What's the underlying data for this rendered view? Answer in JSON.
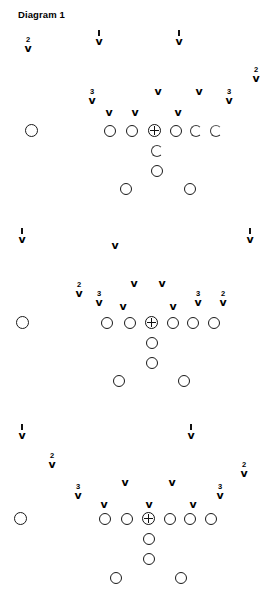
{
  "page": {
    "title": "Diagram 1",
    "background_color": "#ffffff",
    "ink_color": "#111111",
    "width": 271,
    "height": 606
  },
  "legend": {
    "offense_symbol": "open-circle",
    "center_symbol": "circle-with-cross",
    "defense_symbol": "chevron-v",
    "level_labels": [
      "1",
      "2",
      "3"
    ]
  },
  "diagrams": [
    {
      "id": "diagram-1",
      "name": "Diagram 1",
      "title": "Diagram 1",
      "title_x": 18,
      "title_y": 10,
      "offense": [
        {
          "name": "split-end-left",
          "x": 25,
          "y": 124,
          "size": "lg",
          "style": "solid"
        },
        {
          "name": "left-tackle",
          "x": 104,
          "y": 125,
          "size": "md",
          "style": "solid"
        },
        {
          "name": "left-guard",
          "x": 126,
          "y": 125,
          "size": "md",
          "style": "solid"
        },
        {
          "name": "right-guard",
          "x": 170,
          "y": 125,
          "size": "md",
          "style": "solid"
        },
        {
          "name": "right-tackle",
          "x": 190,
          "y": 125,
          "size": "md",
          "style": "clip"
        },
        {
          "name": "tight-end",
          "x": 210,
          "y": 125,
          "size": "md",
          "style": "clip2"
        },
        {
          "name": "quarterback",
          "x": 151,
          "y": 145,
          "size": "md",
          "style": "clip"
        },
        {
          "name": "fullback",
          "x": 151,
          "y": 165,
          "size": "md",
          "style": "solid"
        },
        {
          "name": "halfback-left",
          "x": 120,
          "y": 183,
          "size": "md",
          "style": "solid"
        },
        {
          "name": "halfback-right",
          "x": 184,
          "y": 183,
          "size": "md",
          "style": "solid"
        }
      ],
      "center": {
        "name": "center",
        "x": 148,
        "y": 124
      },
      "defense": [
        {
          "name": "defender-deep-left",
          "label": "2",
          "mark": "number",
          "x": 21,
          "y": 36
        },
        {
          "name": "defender-deep-midleft",
          "label": "1",
          "mark": "tick",
          "x": 92,
          "y": 30
        },
        {
          "name": "defender-deep-midright",
          "label": "1",
          "mark": "tick",
          "x": 172,
          "y": 30
        },
        {
          "name": "defender-deep-right",
          "label": "2",
          "mark": "number",
          "x": 249,
          "y": 66
        },
        {
          "name": "defender-lb-left",
          "label": "3",
          "mark": "number",
          "x": 85,
          "y": 88
        },
        {
          "name": "defender-mid-left",
          "label": "",
          "mark": "none",
          "x": 151,
          "y": 78
        },
        {
          "name": "defender-mid-right",
          "label": "",
          "mark": "none",
          "x": 192,
          "y": 78
        },
        {
          "name": "defender-line-1",
          "label": "",
          "mark": "none",
          "x": 102,
          "y": 99
        },
        {
          "name": "defender-line-2",
          "label": "",
          "mark": "none",
          "x": 128,
          "y": 99
        },
        {
          "name": "defender-line-3",
          "label": "",
          "mark": "none",
          "x": 171,
          "y": 99
        },
        {
          "name": "defender-lb-right",
          "label": "3",
          "mark": "number",
          "x": 222,
          "y": 88
        }
      ]
    },
    {
      "id": "diagram-2",
      "name": "Diagram 2",
      "title": "",
      "title_x": 0,
      "title_y": 0,
      "offense": [
        {
          "name": "split-end-left",
          "x": 16,
          "y": 316,
          "size": "lg",
          "style": "solid"
        },
        {
          "name": "left-tackle",
          "x": 101,
          "y": 317,
          "size": "md",
          "style": "solid"
        },
        {
          "name": "left-guard",
          "x": 124,
          "y": 317,
          "size": "md",
          "style": "solid"
        },
        {
          "name": "right-guard",
          "x": 167,
          "y": 317,
          "size": "md",
          "style": "solid"
        },
        {
          "name": "right-tackle",
          "x": 187,
          "y": 317,
          "size": "md",
          "style": "solid"
        },
        {
          "name": "tight-end",
          "x": 208,
          "y": 317,
          "size": "md",
          "style": "solid"
        },
        {
          "name": "quarterback",
          "x": 146,
          "y": 337,
          "size": "md",
          "style": "solid"
        },
        {
          "name": "fullback",
          "x": 146,
          "y": 357,
          "size": "md",
          "style": "solid"
        },
        {
          "name": "halfback-left",
          "x": 113,
          "y": 375,
          "size": "md",
          "style": "solid"
        },
        {
          "name": "halfback-right",
          "x": 178,
          "y": 375,
          "size": "md",
          "style": "solid"
        }
      ],
      "center": {
        "name": "center",
        "x": 145,
        "y": 316
      },
      "defense": [
        {
          "name": "defender-deep-left",
          "label": "1",
          "mark": "tick",
          "x": 15,
          "y": 228
        },
        {
          "name": "defender-deep-mid",
          "label": "",
          "mark": "none",
          "x": 108,
          "y": 232
        },
        {
          "name": "defender-deep-right",
          "label": "1",
          "mark": "tick",
          "x": 243,
          "y": 228
        },
        {
          "name": "defender-mid-left",
          "label": "",
          "mark": "none",
          "x": 127,
          "y": 270
        },
        {
          "name": "defender-mid-right",
          "label": "",
          "mark": "none",
          "x": 155,
          "y": 270
        },
        {
          "name": "defender-cb-left",
          "label": "2",
          "mark": "number",
          "x": 72,
          "y": 281
        },
        {
          "name": "defender-lb-left",
          "label": "3",
          "mark": "number",
          "x": 92,
          "y": 290
        },
        {
          "name": "defender-line-left",
          "label": "",
          "mark": "none",
          "x": 116,
          "y": 293
        },
        {
          "name": "defender-line-right",
          "label": "",
          "mark": "none",
          "x": 166,
          "y": 293
        },
        {
          "name": "defender-lb-right",
          "label": "3",
          "mark": "number",
          "x": 191,
          "y": 290
        },
        {
          "name": "defender-cb-right",
          "label": "2",
          "mark": "number",
          "x": 216,
          "y": 290
        }
      ]
    },
    {
      "id": "diagram-3",
      "name": "Diagram 3",
      "title": "",
      "title_x": 0,
      "title_y": 0,
      "offense": [
        {
          "name": "split-end-left",
          "x": 14,
          "y": 512,
          "size": "lg",
          "style": "solid"
        },
        {
          "name": "left-tackle",
          "x": 99,
          "y": 513,
          "size": "md",
          "style": "solid"
        },
        {
          "name": "left-guard",
          "x": 121,
          "y": 513,
          "size": "md",
          "style": "solid"
        },
        {
          "name": "right-guard",
          "x": 164,
          "y": 513,
          "size": "md",
          "style": "solid"
        },
        {
          "name": "right-tackle",
          "x": 184,
          "y": 513,
          "size": "md",
          "style": "solid"
        },
        {
          "name": "tight-end",
          "x": 205,
          "y": 513,
          "size": "md",
          "style": "solid"
        },
        {
          "name": "quarterback",
          "x": 143,
          "y": 533,
          "size": "md",
          "style": "solid"
        },
        {
          "name": "fullback",
          "x": 143,
          "y": 553,
          "size": "md",
          "style": "solid"
        },
        {
          "name": "halfback-left",
          "x": 110,
          "y": 572,
          "size": "md",
          "style": "solid"
        },
        {
          "name": "halfback-right",
          "x": 175,
          "y": 572,
          "size": "md",
          "style": "solid"
        }
      ],
      "center": {
        "name": "center",
        "x": 142,
        "y": 512
      },
      "defense": [
        {
          "name": "defender-deep-left",
          "label": "1",
          "mark": "tick",
          "x": 15,
          "y": 424
        },
        {
          "name": "defender-deep-right",
          "label": "1",
          "mark": "tick",
          "x": 184,
          "y": 424
        },
        {
          "name": "defender-cb-left",
          "label": "2",
          "mark": "number",
          "x": 45,
          "y": 452
        },
        {
          "name": "defender-mid-left",
          "label": "",
          "mark": "none",
          "x": 118,
          "y": 469
        },
        {
          "name": "defender-mid-right",
          "label": "",
          "mark": "none",
          "x": 165,
          "y": 469
        },
        {
          "name": "defender-cb-right",
          "label": "2",
          "mark": "number",
          "x": 237,
          "y": 461
        },
        {
          "name": "defender-lb-left",
          "label": "3",
          "mark": "number",
          "x": 71,
          "y": 483
        },
        {
          "name": "defender-line-1",
          "label": "",
          "mark": "none",
          "x": 97,
          "y": 491
        },
        {
          "name": "defender-line-2",
          "label": "",
          "mark": "none",
          "x": 142,
          "y": 491
        },
        {
          "name": "defender-line-3",
          "label": "",
          "mark": "none",
          "x": 186,
          "y": 491
        },
        {
          "name": "defender-lb-right",
          "label": "3",
          "mark": "number",
          "x": 213,
          "y": 483
        }
      ]
    }
  ]
}
